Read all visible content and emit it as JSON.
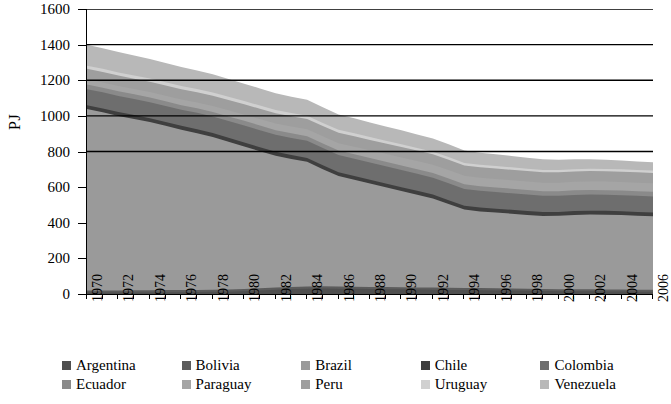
{
  "chart_data": {
    "type": "area",
    "stacked": true,
    "title": "",
    "xlabel": "",
    "ylabel": "PJ",
    "ylim": [
      0,
      1600
    ],
    "ytick_step": 200,
    "yticks": [
      "1600",
      "1400",
      "1200",
      "1000",
      "800",
      "600",
      "400",
      "200",
      "0"
    ],
    "grid": "horizontal",
    "gridlines": [
      1600,
      1400,
      1200,
      1000,
      800
    ],
    "legend_position": "bottom",
    "x": [
      1970,
      1971,
      1972,
      1973,
      1974,
      1975,
      1976,
      1977,
      1978,
      1979,
      1980,
      1981,
      1982,
      1983,
      1984,
      1985,
      1986,
      1987,
      1988,
      1989,
      1990,
      1991,
      1992,
      1993,
      1994,
      1995,
      1996,
      1997,
      1998,
      1999,
      2000,
      2001,
      2002,
      2003,
      2004,
      2005,
      2006
    ],
    "xtick_labels": [
      "1970",
      "1972",
      "1974",
      "1976",
      "1978",
      "1980",
      "1982",
      "1984",
      "1986",
      "1988",
      "1990",
      "1992",
      "1994",
      "1996",
      "1998",
      "2000",
      "2002",
      "2004",
      "2006"
    ],
    "series": [
      {
        "name": "Argentina",
        "color": "#4f4f4f",
        "values": [
          8,
          8,
          8,
          9,
          9,
          10,
          10,
          11,
          12,
          13,
          16,
          20,
          24,
          28,
          30,
          31,
          30,
          29,
          28,
          27,
          26,
          25,
          24,
          23,
          22,
          21,
          20,
          19,
          18,
          17,
          16,
          15,
          15,
          14,
          14,
          13,
          13
        ]
      },
      {
        "name": "Bolivia",
        "color": "#5c5c5c",
        "values": [
          12,
          12,
          12,
          12,
          12,
          12,
          12,
          12,
          12,
          12,
          12,
          12,
          12,
          12,
          12,
          12,
          12,
          12,
          12,
          12,
          12,
          12,
          12,
          12,
          12,
          12,
          12,
          12,
          11,
          11,
          11,
          11,
          11,
          11,
          11,
          11,
          11
        ]
      },
      {
        "name": "Brazil",
        "color": "#9a9a9a",
        "values": [
          1018,
          1000,
          980,
          962,
          944,
          922,
          900,
          880,
          858,
          830,
          800,
          770,
          740,
          718,
          700,
          658,
          620,
          600,
          580,
          560,
          540,
          520,
          500,
          470,
          440,
          430,
          425,
          420,
          415,
          410,
          412,
          418,
          420,
          420,
          418,
          415,
          412
        ]
      },
      {
        "name": "Chile",
        "color": "#3f3f3f",
        "values": [
          22,
          22,
          22,
          22,
          22,
          22,
          22,
          22,
          22,
          22,
          22,
          22,
          22,
          22,
          22,
          22,
          22,
          22,
          22,
          22,
          22,
          22,
          22,
          22,
          22,
          22,
          22,
          22,
          22,
          22,
          22,
          22,
          22,
          22,
          22,
          22,
          22
        ]
      },
      {
        "name": "Colombia",
        "color": "#6e6e6e",
        "values": [
          90,
          90,
          90,
          90,
          90,
          90,
          90,
          92,
          92,
          94,
          96,
          96,
          96,
          96,
          96,
          96,
          96,
          96,
          96,
          96,
          96,
          96,
          95,
          95,
          94,
          94,
          93,
          92,
          92,
          91,
          90,
          90,
          90,
          90,
          90,
          90,
          90
        ]
      },
      {
        "name": "Ecuador",
        "color": "#8a8a8a",
        "values": [
          26,
          26,
          26,
          26,
          26,
          26,
          26,
          26,
          26,
          26,
          26,
          26,
          26,
          26,
          26,
          26,
          26,
          26,
          26,
          26,
          26,
          26,
          26,
          26,
          26,
          26,
          26,
          26,
          26,
          26,
          26,
          26,
          26,
          26,
          26,
          26,
          26
        ]
      },
      {
        "name": "Paraguay",
        "color": "#a5a5a5",
        "values": [
          30,
          30,
          30,
          30,
          31,
          31,
          32,
          32,
          33,
          34,
          35,
          36,
          37,
          38,
          39,
          40,
          41,
          42,
          43,
          44,
          45,
          46,
          47,
          48,
          48,
          48,
          48,
          48,
          48,
          48,
          48,
          48,
          48,
          48,
          48,
          48,
          48
        ]
      },
      {
        "name": "Peru",
        "color": "#9e9e9e",
        "values": [
          58,
          58,
          58,
          58,
          58,
          58,
          58,
          58,
          58,
          58,
          58,
          58,
          58,
          58,
          58,
          58,
          58,
          58,
          58,
          58,
          58,
          58,
          58,
          58,
          58,
          58,
          58,
          58,
          58,
          58,
          58,
          58,
          58,
          58,
          58,
          58,
          58
        ]
      },
      {
        "name": "Uruguay",
        "color": "#d0d0d0",
        "values": [
          18,
          18,
          18,
          18,
          18,
          18,
          18,
          18,
          18,
          18,
          18,
          18,
          18,
          18,
          18,
          17,
          17,
          17,
          16,
          16,
          16,
          15,
          15,
          15,
          14,
          14,
          14,
          14,
          13,
          13,
          13,
          13,
          13,
          13,
          13,
          13,
          13
        ]
      },
      {
        "name": "Venezuela",
        "color": "#b8b8b8",
        "values": [
          118,
          116,
          114,
          112,
          110,
          108,
          106,
          104,
          102,
          100,
          98,
          96,
          94,
          92,
          90,
          88,
          86,
          84,
          82,
          80,
          78,
          76,
          74,
          72,
          70,
          68,
          66,
          64,
          62,
          60,
          58,
          56,
          54,
          52,
          50,
          48,
          46
        ]
      }
    ],
    "totals": [
      1400,
      1380,
      1358,
      1339,
      1320,
      1297,
      1274,
      1257,
      1235,
      1209,
      1183,
      1154,
      1127,
      1108,
      1093,
      1048,
      1008,
      986,
      963,
      941,
      919,
      896,
      873,
      841,
      806,
      793,
      784,
      775,
      765,
      756,
      754,
      757,
      757,
      754,
      750,
      744,
      739
    ]
  },
  "legend": {
    "rows": [
      [
        {
          "label": "Argentina"
        },
        {
          "label": "Bolivia"
        },
        {
          "label": "Brazil"
        },
        {
          "label": "Chile"
        },
        {
          "label": "Colombia"
        }
      ],
      [
        {
          "label": "Ecuador"
        },
        {
          "label": "Paraguay"
        },
        {
          "label": "Peru"
        },
        {
          "label": "Uruguay"
        },
        {
          "label": "Venezuela"
        }
      ]
    ]
  }
}
